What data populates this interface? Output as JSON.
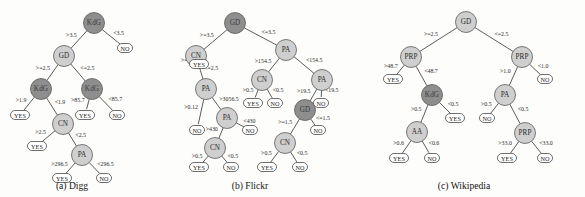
{
  "figure": {
    "type": "decision-tree-panels",
    "panel_count": 3,
    "node_shapes": {
      "internal": "circle",
      "leaf": "rounded-rectangle"
    },
    "colors": {
      "node_light": "#cfcfcf",
      "node_dark": "#8e8e8e",
      "leaf_fill": "#ffffff",
      "edge_stroke": "#4a4a4a",
      "text": "#232323",
      "background": "#fdfdfb"
    },
    "leaf_labels": {
      "yes": "YES",
      "no": "NO"
    }
  },
  "panels": [
    {
      "id": "a",
      "caption": "(a) Digg",
      "nodes": [
        {
          "id": "a1",
          "label": "KdG",
          "shade": "dark",
          "cx": 94,
          "cy": 23
        },
        {
          "id": "a2",
          "label": "GD",
          "shade": "light",
          "cx": 64,
          "cy": 56
        },
        {
          "id": "a3",
          "label": "KdG",
          "shade": "dark",
          "cx": 41,
          "cy": 89
        },
        {
          "id": "a4",
          "label": "KdG",
          "shade": "dark",
          "cx": 92,
          "cy": 89
        },
        {
          "id": "a5",
          "label": "CN",
          "shade": "light",
          "cx": 63,
          "cy": 124
        },
        {
          "id": "a6",
          "label": "PA",
          "shade": "light",
          "cx": 82,
          "cy": 155
        }
      ],
      "leaves": [
        {
          "id": "aL1",
          "label": "NO",
          "cx": 125,
          "cy": 48
        },
        {
          "id": "aL2",
          "label": "YES",
          "cx": 20,
          "cy": 115
        },
        {
          "id": "aL3",
          "label": "YES",
          "cx": 85,
          "cy": 115
        },
        {
          "id": "aL4",
          "label": "NO",
          "cx": 117,
          "cy": 115
        },
        {
          "id": "aL5",
          "label": "YES",
          "cx": 37,
          "cy": 146
        },
        {
          "id": "aL6",
          "label": "YES",
          "cx": 62,
          "cy": 178
        },
        {
          "id": "aL7",
          "label": "NO",
          "cx": 104,
          "cy": 178
        }
      ],
      "edges": [
        {
          "from": "a1",
          "to": "a2",
          "label": ">3.5",
          "side": "left"
        },
        {
          "from": "a1",
          "to": "aL1",
          "label": "<3.5",
          "side": "right"
        },
        {
          "from": "a2",
          "to": "a3",
          "label": ">=2.5",
          "side": "left"
        },
        {
          "from": "a2",
          "to": "a4",
          "label": "<=2.5",
          "side": "right"
        },
        {
          "from": "a3",
          "to": "aL2",
          "label": ">1.9",
          "side": "left"
        },
        {
          "from": "a3",
          "to": "a5",
          "label": "<1.9",
          "side": "right"
        },
        {
          "from": "a4",
          "to": "aL3",
          "label": ">85.7",
          "side": "left"
        },
        {
          "from": "a4",
          "to": "aL4",
          "label": "<85.7",
          "side": "right"
        },
        {
          "from": "a5",
          "to": "aL5",
          "label": ">2.5",
          "side": "left"
        },
        {
          "from": "a5",
          "to": "a6",
          "label": "<2.5",
          "side": "right"
        },
        {
          "from": "a6",
          "to": "aL6",
          "label": ">296.5",
          "side": "left"
        },
        {
          "from": "a6",
          "to": "aL7",
          "label": "<296.5",
          "side": "right"
        }
      ]
    },
    {
      "id": "b",
      "caption": "(b) Flickr",
      "nodes": [
        {
          "id": "b1",
          "label": "GD",
          "shade": "dark",
          "cx": 235,
          "cy": 23
        },
        {
          "id": "b2",
          "label": "CN",
          "shade": "light",
          "cx": 196,
          "cy": 56
        },
        {
          "id": "b3",
          "label": "PA",
          "shade": "light",
          "cx": 286,
          "cy": 50
        },
        {
          "id": "b4",
          "label": "PA",
          "shade": "light",
          "cx": 206,
          "cy": 89
        },
        {
          "id": "b5",
          "label": "CN",
          "shade": "light",
          "cx": 262,
          "cy": 80
        },
        {
          "id": "b6",
          "label": "PA",
          "shade": "light",
          "cx": 322,
          "cy": 80
        },
        {
          "id": "b7",
          "label": "PA",
          "shade": "light",
          "cx": 227,
          "cy": 118
        },
        {
          "id": "b8",
          "label": "GD",
          "shade": "dark",
          "cx": 305,
          "cy": 110
        },
        {
          "id": "b9",
          "label": "CN",
          "shade": "light",
          "cx": 215,
          "cy": 148
        },
        {
          "id": "b10",
          "label": "CN",
          "shade": "light",
          "cx": 285,
          "cy": 143
        }
      ],
      "leaves": [
        {
          "id": "bL1",
          "label": "YES",
          "cx": 199,
          "cy": 64
        },
        {
          "id": "bL2",
          "label": "YES",
          "cx": 253,
          "cy": 103
        },
        {
          "id": "bL3",
          "label": "NO",
          "cx": 275,
          "cy": 103
        },
        {
          "id": "bL4",
          "label": "NO",
          "cx": 321,
          "cy": 103
        },
        {
          "id": "bL5",
          "label": "NO",
          "cx": 197,
          "cy": 130
        },
        {
          "id": "bL6",
          "label": "NO",
          "cx": 250,
          "cy": 130
        },
        {
          "id": "bL7",
          "label": "NO",
          "cx": 318,
          "cy": 130
        },
        {
          "id": "bL8",
          "label": "YES",
          "cx": 199,
          "cy": 167
        },
        {
          "id": "bL9",
          "label": "NO",
          "cx": 231,
          "cy": 167
        },
        {
          "id": "bL10",
          "label": "YES",
          "cx": 267,
          "cy": 167
        },
        {
          "id": "bL11",
          "label": "NO",
          "cx": 300,
          "cy": 167
        }
      ],
      "edges": [
        {
          "from": "b1",
          "to": "b2",
          "label": ">=3.5",
          "side": "left"
        },
        {
          "from": "b1",
          "to": "b3",
          "label": "<=3.5",
          "side": "right"
        },
        {
          "from": "b2",
          "to": "bL1",
          "label": ">=2.5",
          "side": "left"
        },
        {
          "from": "b2",
          "to": "b4",
          "label": "<=2.5",
          "side": "right"
        },
        {
          "from": "b3",
          "to": "b5",
          "label": ">154.5",
          "side": "left"
        },
        {
          "from": "b3",
          "to": "b6",
          "label": "<154.5",
          "side": "right"
        },
        {
          "from": "b4",
          "to": "b7",
          "label": ">3056.5",
          "side": "right"
        },
        {
          "from": "b4",
          "to": "bL5",
          "label": ">0.12",
          "side": "left"
        },
        {
          "from": "b5",
          "to": "bL2",
          "label": ">0.5",
          "side": "left"
        },
        {
          "from": "b5",
          "to": "bL3",
          "label": "<0.5",
          "side": "right"
        },
        {
          "from": "b6",
          "to": "b8",
          "label": ">19.5",
          "side": "left"
        },
        {
          "from": "b6",
          "to": "bL4",
          "label": "<19.5",
          "side": "right"
        },
        {
          "from": "b7",
          "to": "b9",
          "label": ">430",
          "side": "left"
        },
        {
          "from": "b7",
          "to": "bL6",
          "label": "<430",
          "side": "right"
        },
        {
          "from": "b8",
          "to": "b10",
          "label": ">=1.5",
          "side": "left"
        },
        {
          "from": "b8",
          "to": "bL7",
          "label": "<=1.5",
          "side": "right"
        },
        {
          "from": "b9",
          "to": "bL8",
          "label": ">0.5",
          "side": "left"
        },
        {
          "from": "b9",
          "to": "bL9",
          "label": "<0.5",
          "side": "right"
        },
        {
          "from": "b10",
          "to": "bL10",
          "label": ">0.5",
          "side": "left"
        },
        {
          "from": "b10",
          "to": "bL11",
          "label": "<0.5",
          "side": "right"
        }
      ]
    },
    {
      "id": "c",
      "caption": "(c) Wikipedia",
      "nodes": [
        {
          "id": "c1",
          "label": "GD",
          "shade": "light",
          "cx": 466,
          "cy": 22
        },
        {
          "id": "c2",
          "label": "PRP",
          "shade": "light",
          "cx": 411,
          "cy": 57
        },
        {
          "id": "c3",
          "label": "PRP",
          "shade": "light",
          "cx": 522,
          "cy": 57
        },
        {
          "id": "c4",
          "label": "KdG",
          "shade": "dark",
          "cx": 432,
          "cy": 95
        },
        {
          "id": "c5",
          "label": "PA",
          "shade": "light",
          "cx": 505,
          "cy": 95
        },
        {
          "id": "c6",
          "label": "AA",
          "shade": "light",
          "cx": 417,
          "cy": 132
        },
        {
          "id": "c7",
          "label": "PRP",
          "shade": "light",
          "cx": 525,
          "cy": 133
        }
      ],
      "leaves": [
        {
          "id": "cL1",
          "label": "YES",
          "cx": 393,
          "cy": 79
        },
        {
          "id": "cL2",
          "label": "NO",
          "cx": 545,
          "cy": 79
        },
        {
          "id": "cL3",
          "label": "YES",
          "cx": 455,
          "cy": 118
        },
        {
          "id": "cL4",
          "label": "NO",
          "cx": 487,
          "cy": 118
        },
        {
          "id": "cL5",
          "label": "YES",
          "cx": 399,
          "cy": 158
        },
        {
          "id": "cL6",
          "label": "NO",
          "cx": 432,
          "cy": 158
        },
        {
          "id": "cL7",
          "label": "YES",
          "cx": 507,
          "cy": 158
        },
        {
          "id": "cL8",
          "label": "NO",
          "cx": 545,
          "cy": 158
        }
      ],
      "edges": [
        {
          "from": "c1",
          "to": "c2",
          "label": ">=2.5",
          "side": "left"
        },
        {
          "from": "c1",
          "to": "c3",
          "label": "<=2.5",
          "side": "right"
        },
        {
          "from": "c2",
          "to": "cL1",
          "label": ">48.7",
          "side": "left"
        },
        {
          "from": "c2",
          "to": "c4",
          "label": "<48.7",
          "side": "right"
        },
        {
          "from": "c3",
          "to": "c5",
          "label": ">1.0",
          "side": "left"
        },
        {
          "from": "c3",
          "to": "cL2",
          "label": "<1.0",
          "side": "right"
        },
        {
          "from": "c4",
          "to": "c6",
          "label": ">0.5",
          "side": "left"
        },
        {
          "from": "c4",
          "to": "cL3",
          "label": "<0.5",
          "side": "right"
        },
        {
          "from": "c5",
          "to": "cL4",
          "label": ">0.5",
          "side": "left"
        },
        {
          "from": "c5",
          "to": "c7",
          "label": "<0.5",
          "side": "right"
        },
        {
          "from": "c6",
          "to": "cL5",
          "label": ">0.6",
          "side": "left"
        },
        {
          "from": "c6",
          "to": "cL6",
          "label": "<0.6",
          "side": "right"
        },
        {
          "from": "c7",
          "to": "cL7",
          "label": ">33.0",
          "side": "left"
        },
        {
          "from": "c7",
          "to": "cL8",
          "label": "<33.0",
          "side": "right"
        }
      ],
      "caption_x": 484
    }
  ],
  "captions": [
    {
      "text": "(a) Digg",
      "x": 72,
      "y": 189
    },
    {
      "text": "(b) Flickr",
      "x": 250,
      "y": 189
    },
    {
      "text": "(c) Wikipedia",
      "x": 464,
      "y": 189
    }
  ]
}
